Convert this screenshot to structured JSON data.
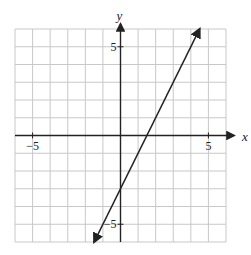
{
  "chart_data": {
    "type": "line",
    "title": "",
    "xlabel": "x",
    "ylabel": "y",
    "xlim": [
      -6,
      6
    ],
    "ylim": [
      -6,
      6
    ],
    "grid": true,
    "grid_step": 1,
    "tick_labels": {
      "x": [
        {
          "value": -5,
          "label": "−5"
        },
        {
          "value": 5,
          "label": "5"
        }
      ],
      "y": [
        {
          "value": 5,
          "label": "5"
        },
        {
          "value": -5,
          "label": "−5"
        }
      ]
    },
    "series": [
      {
        "name": "y = 2x − 3",
        "equation": "y = 2x - 3",
        "slope": 2,
        "intercept": -3,
        "x": [
          -1.5,
          0,
          1.5,
          4.5
        ],
        "y": [
          -6,
          -3,
          0,
          6
        ],
        "arrows_both_ends": true
      }
    ],
    "legend": null
  },
  "colors": {
    "grid": "#c8c8c8",
    "axis": "#222222",
    "line": "#222222",
    "background": "#ffffff"
  }
}
